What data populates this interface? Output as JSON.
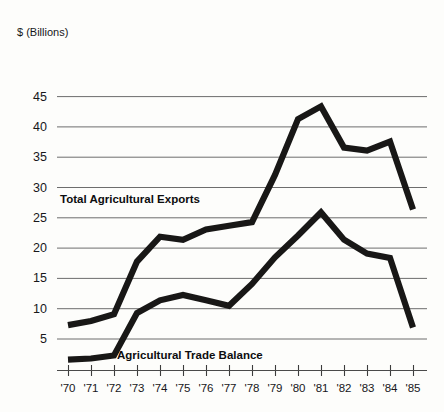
{
  "chart_data": {
    "type": "line",
    "title": "",
    "subtitle": "",
    "xlabel": "",
    "ylabel": "$ (Billions)",
    "unit_label": "$ (Billions)",
    "grid": true,
    "legend_position": "inline-annotation",
    "x": [
      "1970",
      "1971",
      "1972",
      "1973",
      "1974",
      "1975",
      "1976",
      "1977",
      "1978",
      "1979",
      "1980",
      "1981",
      "1982",
      "1983",
      "1984",
      "1985"
    ],
    "categories": [
      "'70",
      "'71",
      "'72",
      "'73",
      "'74",
      "'75",
      "'76",
      "'77",
      "'78",
      "'79",
      "'80",
      "'81",
      "'82",
      "'83",
      "'84",
      "'85"
    ],
    "xtick_labels": [
      "'70",
      "'71",
      "'72",
      "'73",
      "'74",
      "'75",
      "'76",
      "'77",
      "'78",
      "'79",
      "'80",
      "'81",
      "'82",
      "'83",
      "'84",
      "'85"
    ],
    "ytick_labels": [
      "45",
      "40",
      "35",
      "30",
      "25",
      "20",
      "15",
      "10",
      "5"
    ],
    "ytick_values": [
      45,
      40,
      35,
      30,
      25,
      20,
      15,
      10,
      5
    ],
    "ylim": [
      0,
      47
    ],
    "xlim": [
      "'70",
      "'85"
    ],
    "series": [
      {
        "name": "Total Agricultural Exports",
        "label": "Total Agricultural Exports",
        "color": "#181716",
        "values": [
          7.2,
          7.9,
          9.0,
          17.7,
          21.8,
          21.3,
          23.0,
          23.6,
          24.2,
          32.0,
          41.2,
          43.3,
          36.5,
          36.0,
          37.5,
          26.3
        ]
      },
      {
        "name": "Agricultural Trade Balance",
        "label": "Agricultural Trade Balance",
        "color": "#181716",
        "values": [
          1.5,
          1.7,
          2.2,
          9.2,
          11.3,
          12.2,
          11.3,
          10.4,
          14.0,
          18.4,
          22.0,
          25.8,
          21.3,
          19.0,
          18.3,
          6.8
        ]
      }
    ],
    "annotations": [
      {
        "text": "Total Agricultural Exports",
        "series": "Total Agricultural Exports",
        "x": 60,
        "y": 203
      },
      {
        "text": "Agricultural Trade Balance",
        "series": "Agricultural Trade Balance",
        "x": 117,
        "y": 359
      }
    ]
  }
}
